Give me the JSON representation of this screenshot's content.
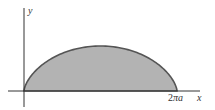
{
  "diagram": {
    "title": "",
    "type": "cycloid-arch-area",
    "axes": {
      "x_label": "x",
      "y_label": "y",
      "x_tick_label_prefix": "2",
      "x_tick_label_pi": "π",
      "x_tick_label_suffix": "a",
      "x_tick_label": "2πa"
    },
    "region": {
      "description": "Shaded region under one arch of a cycloid from x = 0 to x = 2πa",
      "fill_color": "#b3b3b3",
      "stroke_color": "#555555"
    },
    "colors": {
      "axis": "#333333",
      "background": "#ffffff"
    }
  }
}
